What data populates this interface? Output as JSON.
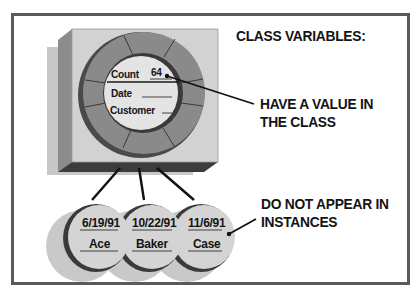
{
  "title": "CLASS VARIABLES:",
  "callouts": {
    "class_value": [
      "HAVE A VALUE IN",
      "THE CLASS"
    ],
    "instances": [
      "DO NOT APPEAR IN",
      "INSTANCES"
    ]
  },
  "class_object": {
    "fields": [
      {
        "name": "Count",
        "value": "64"
      },
      {
        "name": "Date",
        "value": ""
      },
      {
        "name": "Customer",
        "value": ""
      }
    ]
  },
  "instances": [
    {
      "date": "6/19/91",
      "customer": "Ace"
    },
    {
      "date": "10/22/91",
      "customer": "Baker"
    },
    {
      "date": "11/6/91",
      "customer": "Case"
    }
  ],
  "colors": {
    "frame": "#5a5a5a",
    "cube_front": "#d2d2d2",
    "cube_side": "#8c8c8c",
    "cube_bottom": "#3c3c3c",
    "ring": "#8a8a8a",
    "ring_dark": "#555555",
    "core": "#e2e2e2",
    "instance_face": "#d4d4d4",
    "instance_edge": "#3a3a3a",
    "shadow": "#c6c6c6",
    "text": "#141414"
  }
}
